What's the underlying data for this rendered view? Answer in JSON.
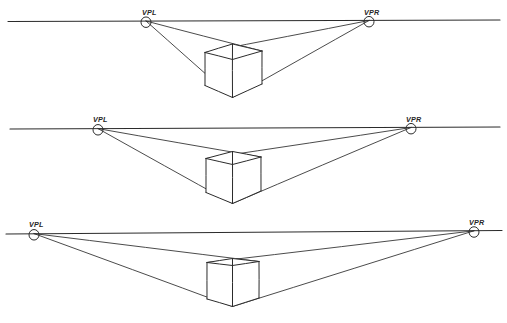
{
  "figure": {
    "background_color": "#ffffff",
    "ink_color": "#2b2b2b",
    "width": 507,
    "height": 323,
    "label_left": "VPL",
    "label_right": "VPR",
    "label_left_meaning": "vanishing-point-left",
    "label_right_meaning": "vanishing-point-right",
    "diagram_count": 3
  },
  "diagrams": [
    {
      "name": "narrow-vanishing-point-spacing",
      "index": 1,
      "horizon": {
        "x1": 8,
        "y1": 21.5,
        "x2": 500,
        "y2": 20.0
      },
      "vpl": {
        "x": 146,
        "y": 21.0,
        "label": "VPL",
        "label_x": 142,
        "label_y": 15.0,
        "r": 5.0
      },
      "vpr": {
        "x": 369,
        "y": 20.5,
        "label": "VPR",
        "label_x": 364,
        "label_y": 14.5,
        "r": 5.0
      },
      "cube": {
        "top_apex": {
          "x": 232.5,
          "y": 44.0
        },
        "top_left": {
          "x": 205.0,
          "y": 52.5
        },
        "top_right": {
          "x": 262.0,
          "y": 51.0
        },
        "top_back": {
          "x": 232.5,
          "y": 59.5
        },
        "bottom_front": {
          "x": 232.5,
          "y": 97.5
        },
        "bottom_left": {
          "x": 205.0,
          "y": 85.5
        },
        "bottom_right": {
          "x": 262.0,
          "y": 84.0
        }
      },
      "ground_lines": [
        {
          "from": "vpl",
          "to_x": 232.5,
          "to_y": 97.5
        },
        {
          "from": "vpr",
          "to_x": 232.5,
          "to_y": 97.5
        },
        {
          "from": "vpl",
          "to_x": 262.0,
          "to_y": 51.0
        },
        {
          "from": "vpr",
          "to_x": 205.0,
          "to_y": 52.5
        }
      ]
    },
    {
      "name": "medium-vanishing-point-spacing",
      "index": 2,
      "horizon": {
        "x1": 10,
        "y1": 129.0,
        "x2": 500,
        "y2": 127.0
      },
      "vpl": {
        "x": 98,
        "y": 128.6,
        "label": "VPL",
        "label_x": 93,
        "label_y": 122.0,
        "r": 5.0
      },
      "vpr": {
        "x": 411,
        "y": 127.5,
        "label": "VPR",
        "label_x": 406,
        "label_y": 121.5,
        "r": 5.0
      },
      "cube": {
        "top_apex": {
          "x": 232.5,
          "y": 151.5
        },
        "top_left": {
          "x": 206.0,
          "y": 158.5
        },
        "top_right": {
          "x": 261.0,
          "y": 157.0
        },
        "top_back": {
          "x": 232.5,
          "y": 164.5
        },
        "bottom_front": {
          "x": 232.5,
          "y": 203.5
        },
        "bottom_left": {
          "x": 206.0,
          "y": 192.5
        },
        "bottom_right": {
          "x": 261.0,
          "y": 191.0
        }
      },
      "ground_lines": [
        {
          "from": "vpl",
          "to_x": 232.5,
          "to_y": 203.5
        },
        {
          "from": "vpr",
          "to_x": 232.5,
          "to_y": 203.5
        },
        {
          "from": "vpl",
          "to_x": 261.0,
          "to_y": 157.0
        },
        {
          "from": "vpr",
          "to_x": 206.0,
          "to_y": 158.5
        }
      ]
    },
    {
      "name": "wide-vanishing-point-spacing",
      "index": 3,
      "horizon": {
        "x1": 6,
        "y1": 234.0,
        "x2": 502,
        "y2": 230.5
      },
      "vpl": {
        "x": 34,
        "y": 233.6,
        "label": "VPL",
        "label_x": 29,
        "label_y": 227.0,
        "r": 5.0
      },
      "vpr": {
        "x": 474,
        "y": 230.8,
        "label": "VPR",
        "label_x": 469,
        "label_y": 224.5,
        "r": 5.0
      },
      "cube": {
        "top_apex": {
          "x": 232.5,
          "y": 258.5
        },
        "top_left": {
          "x": 207.0,
          "y": 262.5
        },
        "top_right": {
          "x": 259.0,
          "y": 261.5
        },
        "top_back": {
          "x": 232.5,
          "y": 265.5
        },
        "bottom_front": {
          "x": 232.5,
          "y": 306.5
        },
        "bottom_left": {
          "x": 207.0,
          "y": 299.0
        },
        "bottom_right": {
          "x": 259.0,
          "y": 298.0
        }
      },
      "ground_lines": [
        {
          "from": "vpl",
          "to_x": 232.5,
          "to_y": 306.5
        },
        {
          "from": "vpr",
          "to_x": 232.5,
          "to_y": 306.5
        },
        {
          "from": "vpl",
          "to_x": 259.0,
          "to_y": 261.5
        },
        {
          "from": "vpr",
          "to_x": 207.0,
          "to_y": 262.5
        }
      ]
    }
  ]
}
